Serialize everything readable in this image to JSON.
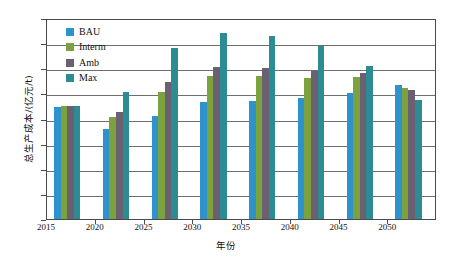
{
  "chart_data": {
    "type": "bar",
    "title": "",
    "xlabel": "年份",
    "ylabel": "总生产成本/(亿元/t)",
    "categories": [
      "2015",
      "2020",
      "2025",
      "2030",
      "2035",
      "2040",
      "2045",
      "2050"
    ],
    "series": [
      {
        "name": "BAU",
        "color": "#2e92cc",
        "values": [
          890,
          720,
          823,
          932,
          942,
          962,
          1000,
          1070
        ]
      },
      {
        "name": "Interm",
        "color": "#7ba23f",
        "values": [
          900,
          812,
          1015,
          1140,
          1140,
          1122,
          1133,
          1040
        ]
      },
      {
        "name": "Amb",
        "color": "#6b5f72",
        "values": [
          900,
          852,
          1087,
          1210,
          1200,
          1176,
          1162,
          1030
        ]
      },
      {
        "name": "Max",
        "color": "#2d8b94",
        "values": [
          903,
          1010,
          1360,
          1480,
          1455,
          1375,
          1215,
          950
        ]
      }
    ],
    "ylim": [
      0,
      1600
    ],
    "ytick_values": [
      0,
      200,
      400,
      600,
      800,
      1000,
      1200,
      1400,
      1600
    ],
    "ytick_labels": [
      "0",
      "200",
      "400",
      "600",
      "800",
      "1000",
      "1200",
      "1400",
      "1600"
    ],
    "xtick_labels": [
      "2015",
      "2020",
      "2025",
      "2030",
      "2035",
      "2040",
      "2045",
      "2050"
    ],
    "grid": true,
    "legend_position": "upper-left",
    "legend_entries": [
      "BAU",
      "Interm",
      "Amb",
      "Max"
    ]
  }
}
